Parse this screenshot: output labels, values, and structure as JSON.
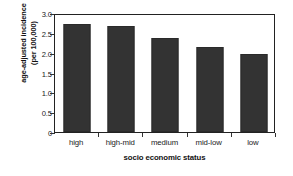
{
  "chart_data": {
    "type": "bar",
    "title": "",
    "categories": [
      "high",
      "high-mid",
      "medium",
      "mid-low",
      "low"
    ],
    "values": [
      2.72,
      2.68,
      2.36,
      2.15,
      1.96
    ],
    "xlabel": "socio economic status",
    "ylabel": "age-adjusted incidence (per 100,000)",
    "ylabel_lines": [
      "age-adjusted incidence",
      "(per 100,000)"
    ],
    "ylim": [
      0,
      3.0
    ],
    "yticks": [
      0,
      0.5,
      1.0,
      1.5,
      2.0,
      2.5,
      3.0
    ],
    "ytick_labels": [
      "0",
      "0.5",
      "1.0",
      "1.5",
      "2.0",
      "2.5",
      "3.0"
    ],
    "grid": false,
    "legend": null,
    "bar_color": "#333333",
    "axis_color": "#222222",
    "background": "#ffffff"
  }
}
